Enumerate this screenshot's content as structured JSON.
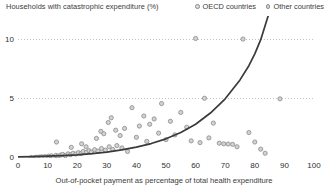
{
  "chart_data": {
    "type": "scatter",
    "title": "Households with catastrophic expenditure (%)",
    "ylabel": "Households with catastrophic expenditure (%)",
    "xlabel": "Out-of-pocket payment as percentage of total health expenditure",
    "xlim": [
      0,
      100
    ],
    "ylim": [
      0,
      12
    ],
    "xticks": [
      0,
      10,
      20,
      30,
      40,
      50,
      60,
      70,
      80,
      90,
      100
    ],
    "yticks": [
      0,
      5,
      10
    ],
    "grid": "horizontal-dotted",
    "legend_position": "top-right",
    "legend": [
      {
        "name": "OECD countries",
        "marker": "open-circle",
        "color": "#9a9a9a"
      },
      {
        "name": "Other countries",
        "marker": "open-circle",
        "color": "#9a9a9a"
      }
    ],
    "series": [
      {
        "name": "OECD countries",
        "points": [
          [
            5.8,
            0.05
          ],
          [
            7.2,
            0.08
          ],
          [
            8.0,
            0.1
          ],
          [
            9.1,
            0.12
          ],
          [
            10.3,
            0.15
          ],
          [
            11.2,
            0.18
          ],
          [
            12.0,
            0.1
          ],
          [
            12.8,
            0.22
          ],
          [
            13.5,
            0.16
          ],
          [
            14.4,
            0.25
          ],
          [
            15.1,
            0.3
          ],
          [
            16.0,
            0.2
          ],
          [
            16.9,
            0.35
          ],
          [
            17.8,
            0.28
          ],
          [
            18.6,
            0.4
          ],
          [
            19.5,
            0.33
          ],
          [
            20.4,
            0.45
          ],
          [
            21.3,
            0.38
          ],
          [
            22.0,
            0.55
          ],
          [
            23.1,
            0.48
          ],
          [
            24.0,
            0.62
          ],
          [
            24.8,
            0.5
          ],
          [
            25.9,
            0.7
          ],
          [
            27.0,
            0.58
          ],
          [
            28.2,
            0.8
          ],
          [
            29.5,
            0.66
          ],
          [
            30.8,
            0.95
          ],
          [
            32.0,
            0.72
          ],
          [
            33.4,
            1.05
          ],
          [
            35.1,
            0.85
          ]
        ]
      },
      {
        "name": "Other countries",
        "points": [
          [
            4.5,
            0.04
          ],
          [
            6.3,
            0.06
          ],
          [
            13.0,
            1.35
          ],
          [
            18.0,
            0.9
          ],
          [
            21.5,
            1.2
          ],
          [
            23.0,
            0.95
          ],
          [
            26.5,
            1.65
          ],
          [
            28.0,
            2.25
          ],
          [
            29.0,
            2.05
          ],
          [
            30.5,
            3.0
          ],
          [
            31.5,
            3.4
          ],
          [
            33.0,
            2.35
          ],
          [
            34.5,
            1.9
          ],
          [
            36.0,
            2.5
          ],
          [
            37.0,
            0.55
          ],
          [
            38.5,
            4.25
          ],
          [
            40.0,
            1.75
          ],
          [
            41.0,
            2.7
          ],
          [
            42.5,
            3.55
          ],
          [
            43.5,
            1.4
          ],
          [
            44.5,
            2.85
          ],
          [
            46.0,
            3.3
          ],
          [
            47.5,
            2.1
          ],
          [
            48.5,
            4.6
          ],
          [
            50.0,
            1.55
          ],
          [
            51.5,
            3.1
          ],
          [
            53.0,
            1.95
          ],
          [
            55.0,
            3.85
          ],
          [
            57.0,
            2.6
          ],
          [
            58.5,
            1.45
          ],
          [
            60.0,
            10.1
          ],
          [
            61.5,
            1.3
          ],
          [
            63.0,
            5.05
          ],
          [
            64.5,
            1.7
          ],
          [
            66.0,
            2.95
          ],
          [
            68.0,
            1.25
          ],
          [
            69.5,
            1.2
          ],
          [
            71.0,
            1.18
          ],
          [
            72.5,
            1.15
          ],
          [
            74.0,
            0.95
          ],
          [
            76.0,
            10.05
          ],
          [
            78.0,
            2.15
          ],
          [
            80.0,
            1.35
          ],
          [
            82.0,
            0.75
          ],
          [
            83.5,
            0.4
          ],
          [
            88.5,
            5.0
          ]
        ]
      }
    ],
    "fit_curve": {
      "name": "exponential trend",
      "color": "#3a3a3a",
      "points": [
        [
          0,
          0.1
        ],
        [
          5,
          0.12
        ],
        [
          10,
          0.15
        ],
        [
          15,
          0.2
        ],
        [
          20,
          0.27
        ],
        [
          25,
          0.37
        ],
        [
          30,
          0.5
        ],
        [
          35,
          0.68
        ],
        [
          40,
          0.92
        ],
        [
          45,
          1.22
        ],
        [
          50,
          1.62
        ],
        [
          55,
          2.15
        ],
        [
          60,
          2.85
        ],
        [
          65,
          3.8
        ],
        [
          70,
          5.0
        ],
        [
          75,
          6.6
        ],
        [
          78,
          7.8
        ],
        [
          80,
          8.8
        ],
        [
          82,
          10.0
        ],
        [
          83.5,
          11.2
        ],
        [
          84.5,
          12.0
        ]
      ]
    }
  },
  "axes": {
    "y_tick_labels": [
      "0",
      "5",
      "10"
    ],
    "x_tick_labels": [
      "0",
      "10",
      "20",
      "30",
      "40",
      "50",
      "60",
      "70",
      "80",
      "90",
      "100"
    ]
  },
  "legend": {
    "oecd_label": "OECD countries",
    "other_label": "Other countries"
  },
  "titles": {
    "y_axis_title": "Households with catastrophic expenditure (%)",
    "x_axis_title": "Out-of-pocket payment as percentage of total health expenditure"
  },
  "colors": {
    "marker_fill": "#d2d2d2",
    "marker_stroke": "#8a8a8a",
    "curve": "#3a3a3a",
    "grid": "#b9c4d6",
    "text": "#333333"
  }
}
